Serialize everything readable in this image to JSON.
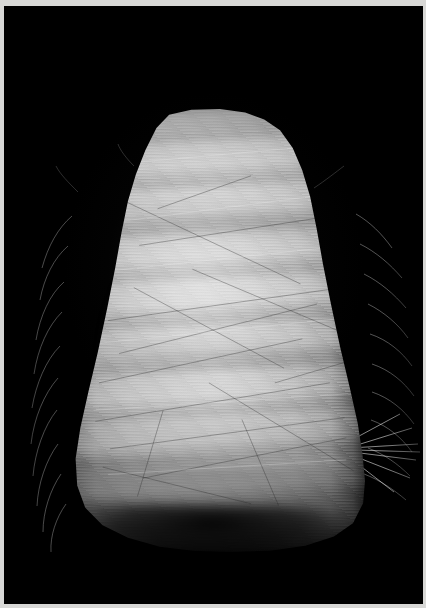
{
  "image": {
    "domain": "Natural-Image",
    "subject_label": "fiber-cone-spool",
    "description": "Close-up studio photograph of a tall cone-shaped spool of wound pale fiber roving, lit from the front-left, isolated on a pure black background.",
    "orientation": "portrait",
    "width_px": 426,
    "height_px": 608
  },
  "frame": {
    "border_label": "photo-print-border",
    "border_color": "#d8d8d6",
    "border_top_px": 6,
    "border_left_px": 4,
    "border_right_px": 3,
    "border_bottom_px": 4
  },
  "background": {
    "label": "black-studio-backdrop",
    "color": "#000000"
  },
  "subject": {
    "label": "wound-fiber-cone",
    "material_appearance": "pale straw / glass fiber roving",
    "shape": "rounded-dome-top tapering bell cone, widest at the base",
    "highlight_color": "#d0d0d0",
    "midtone_color": "#b4b4b4",
    "shadow_color": "#3c3c3c",
    "top_y_px": 108,
    "bottom_y_px": 552,
    "widest_y_px": 442,
    "left_x_px": 55,
    "right_x_px": 372,
    "dome_left_x_px": 140,
    "dome_right_x_px": 272
  },
  "features": {
    "winding_bands": "about a dozen stacked horizontal winding rings bowing downward across the cone",
    "stray_fibers": "fine wispy filaments escaping the silhouette along both flanks",
    "long_filament": "a single long fiber trailing from the right flank toward the right edge at roughly y = 440",
    "base_shadow": "soft dark contact shadow where the cone meets the unseen surface"
  }
}
